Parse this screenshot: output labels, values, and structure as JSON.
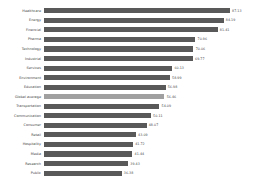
{
  "chart_data": {
    "type": "bar",
    "orientation": "horizontal",
    "title": "",
    "subtitle": "",
    "xlabel": "",
    "ylabel": "",
    "xlim": [
      0,
      90
    ],
    "grid": false,
    "legend": false,
    "bar_color": "#595959",
    "highlight_color": "#a0a0a0",
    "highlight_category": "Global average",
    "categories": [
      "Healthcare",
      "Energy",
      "Financial",
      "Pharma",
      "Technology",
      "Industrial",
      "Services",
      "Environment",
      "Education",
      "Global average",
      "Transportation",
      "Communication",
      "Consumer",
      "Retail",
      "Hospitality",
      "Media",
      "Research",
      "Public"
    ],
    "values": [
      87.13,
      84.19,
      81.41,
      70.96,
      70.06,
      69.77,
      60.13,
      58.99,
      56.98,
      56.46,
      54.09,
      50.11,
      48.07,
      43.09,
      41.72,
      41.44,
      39.43,
      36.38
    ],
    "value_labels": [
      "87.13",
      "84.19",
      "81.41",
      "70.96",
      "70.06",
      "69.77",
      "60.13",
      "58.99",
      "56.98",
      "56.46",
      "54.09",
      "50.11",
      "48.07",
      "43.09",
      "41.72",
      "41.44",
      "39.43",
      "36.38"
    ]
  }
}
